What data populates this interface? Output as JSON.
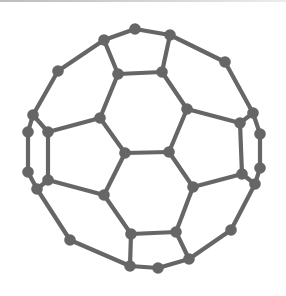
{
  "diagram": {
    "title": "",
    "colors": {
      "bond": "#666666",
      "atom": "#666666",
      "background": "#ffffff",
      "top_border": "#c8c8c8"
    },
    "atom_radius": 5.8,
    "atoms": [
      {
        "id": "A",
        "x": 135,
        "y": 29
      },
      {
        "id": "B",
        "x": 104,
        "y": 40
      },
      {
        "id": "C",
        "x": 170,
        "y": 35
      },
      {
        "id": "D",
        "x": 118,
        "y": 74
      },
      {
        "id": "E",
        "x": 162,
        "y": 72
      },
      {
        "id": "F",
        "x": 58,
        "y": 71
      },
      {
        "id": "G",
        "x": 225,
        "y": 62
      },
      {
        "id": "H",
        "x": 33,
        "y": 115
      },
      {
        "id": "I",
        "x": 28,
        "y": 132
      },
      {
        "id": "J",
        "x": 48,
        "y": 132
      },
      {
        "id": "K",
        "x": 100,
        "y": 118
      },
      {
        "id": "L",
        "x": 187,
        "y": 109
      },
      {
        "id": "M",
        "x": 253,
        "y": 113
      },
      {
        "id": "N",
        "x": 240,
        "y": 123
      },
      {
        "id": "O",
        "x": 260,
        "y": 134
      },
      {
        "id": "P",
        "x": 125,
        "y": 153
      },
      {
        "id": "Q",
        "x": 169,
        "y": 152
      },
      {
        "id": "R",
        "x": 28,
        "y": 172
      },
      {
        "id": "S",
        "x": 48,
        "y": 180
      },
      {
        "id": "T",
        "x": 37,
        "y": 189
      },
      {
        "id": "U",
        "x": 260,
        "y": 168
      },
      {
        "id": "V",
        "x": 242,
        "y": 174
      },
      {
        "id": "W",
        "x": 255,
        "y": 184
      },
      {
        "id": "X",
        "x": 104,
        "y": 195
      },
      {
        "id": "Y",
        "x": 193,
        "y": 187
      },
      {
        "id": "Z",
        "x": 131,
        "y": 234
      },
      {
        "id": "AA",
        "x": 176,
        "y": 232
      },
      {
        "id": "AB",
        "x": 70,
        "y": 240
      },
      {
        "id": "AC",
        "x": 231,
        "y": 230
      },
      {
        "id": "AD",
        "x": 130,
        "y": 266
      },
      {
        "id": "AE",
        "x": 158,
        "y": 268
      },
      {
        "id": "AF",
        "x": 189,
        "y": 259
      }
    ],
    "bonds": [
      [
        "A",
        "B"
      ],
      [
        "A",
        "C"
      ],
      [
        "B",
        "D"
      ],
      [
        "C",
        "E"
      ],
      [
        "D",
        "E"
      ],
      [
        "B",
        "F"
      ],
      [
        "C",
        "G"
      ],
      [
        "F",
        "H"
      ],
      [
        "G",
        "M"
      ],
      [
        "H",
        "I"
      ],
      [
        "H",
        "J"
      ],
      [
        "M",
        "O"
      ],
      [
        "M",
        "N"
      ],
      [
        "D",
        "K"
      ],
      [
        "E",
        "L"
      ],
      [
        "J",
        "K"
      ],
      [
        "L",
        "N"
      ],
      [
        "K",
        "P"
      ],
      [
        "L",
        "Q"
      ],
      [
        "P",
        "Q"
      ],
      [
        "I",
        "R"
      ],
      [
        "J",
        "S"
      ],
      [
        "O",
        "U"
      ],
      [
        "N",
        "V"
      ],
      [
        "R",
        "T"
      ],
      [
        "S",
        "T"
      ],
      [
        "U",
        "W"
      ],
      [
        "V",
        "W"
      ],
      [
        "S",
        "X"
      ],
      [
        "V",
        "Y"
      ],
      [
        "P",
        "X"
      ],
      [
        "Q",
        "Y"
      ],
      [
        "X",
        "Z"
      ],
      [
        "Y",
        "AA"
      ],
      [
        "Z",
        "AA"
      ],
      [
        "T",
        "AB"
      ],
      [
        "W",
        "AC"
      ],
      [
        "AB",
        "AD"
      ],
      [
        "AC",
        "AF"
      ],
      [
        "Z",
        "AD"
      ],
      [
        "AA",
        "AF"
      ],
      [
        "AD",
        "AE"
      ],
      [
        "AE",
        "AF"
      ]
    ]
  }
}
